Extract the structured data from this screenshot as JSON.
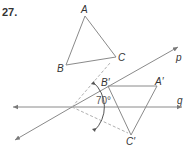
{
  "problem": {
    "number": "27."
  },
  "labels": {
    "A": "A",
    "B": "B",
    "C": "C",
    "A_prime": "A′",
    "B_prime": "B′",
    "C_prime": "C′",
    "line_p": "p",
    "line_q": "q",
    "angle": "70°"
  },
  "colors": {
    "line": "#8a8a8a",
    "dashed": "#b0b0b0",
    "text": "#333333"
  },
  "geometry": {
    "triangle_ABC": {
      "A": [
        85,
        16
      ],
      "B": [
        66,
        65
      ],
      "C": [
        116,
        57
      ]
    },
    "triangle_image": {
      "A_prime": [
        157,
        86
      ],
      "B_prime": [
        108,
        86
      ],
      "C_prime": [
        131,
        135
      ]
    },
    "intersection": [
      72,
      107
    ],
    "angle_between_lines_deg": 70
  }
}
